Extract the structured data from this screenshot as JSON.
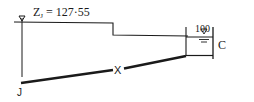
{
  "diagram": {
    "type": "pipe-network-hydraulic-grade",
    "junction": {
      "label": "J",
      "head_label_prefix": "Z",
      "head_label_sub": "J",
      "head_label_value": "= 127·55"
    },
    "pipe": {
      "label": "X"
    },
    "reservoir": {
      "label": "C",
      "level": "100"
    },
    "colors": {
      "line": "#1a1a1a",
      "background": "#ffffff"
    }
  }
}
